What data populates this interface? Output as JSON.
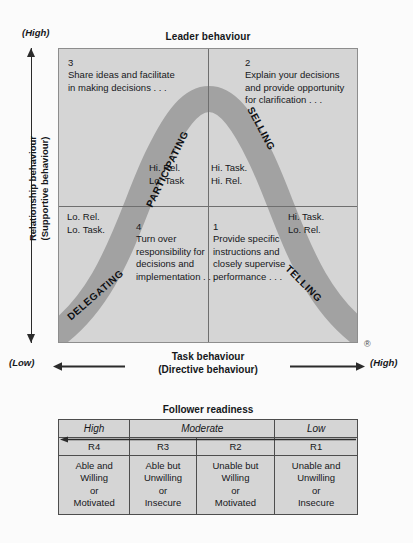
{
  "diagram": {
    "top_axis_title": "Leader behaviour",
    "y_axis": {
      "high_label": "(High)",
      "low_label": "(Low)",
      "title_line1": "Relationship behaviour",
      "title_line2": "(Supportive behaviour)"
    },
    "x_axis": {
      "low_label": "(Low)",
      "high_label": "(High)",
      "title_line1": "Task behaviour",
      "title_line2": "(Directive behaviour)"
    },
    "registered_mark": "®",
    "quadrants": [
      {
        "number": "3",
        "text": "Share ideas and facilitate in making decisions . . ."
      },
      {
        "number": "2",
        "text": "Explain your decisions and provide opportunity for clarification . . ."
      },
      {
        "number": "4",
        "text": "Turn over responsibility for decisions and implementation . . ."
      },
      {
        "number": "1",
        "text": "Provide specific instructions and closely supervise performance . . ."
      }
    ],
    "behaviour_mixes": [
      {
        "line1": "Hi. Rel.",
        "line2": "Lo. Task"
      },
      {
        "line1": "Hi. Task.",
        "line2": "Hi. Rel."
      },
      {
        "line1": "Lo. Rel.",
        "line2": "Lo. Task."
      },
      {
        "line1": "Hi. Task.",
        "line2": "Lo. Rel."
      }
    ],
    "curve_styles": [
      "PARTICIPATING",
      "SELLING",
      "DELEGATING",
      "TELLING"
    ],
    "colors": {
      "plot_background": "#d5d5d5",
      "curve_band": "#a2a2a2",
      "grid_line": "#6f6f6f",
      "axis": "#2b2b2b"
    }
  },
  "follower_readiness": {
    "title": "Follower readiness",
    "levels": [
      "High",
      "Moderate",
      "Low"
    ],
    "codes": [
      "R4",
      "R3",
      "R2",
      "R1"
    ],
    "descriptions": [
      "Able and\nWilling\nor\nMotivated",
      "Able but\nUnwilling\nor\nInsecure",
      "Unable but\nWilling\nor\nMotivated",
      "Unable and\nUnwilling\nor\nInsecure"
    ],
    "cells": [
      {
        "line1": "Able and",
        "line2": "Willing",
        "line3": "or",
        "line4": "Motivated"
      },
      {
        "line1": "Able but",
        "line2": "Unwilling",
        "line3": "or",
        "line4": "Insecure"
      },
      {
        "line1": "Unable but",
        "line2": "Willing",
        "line3": "or",
        "line4": "Motivated"
      },
      {
        "line1": "Unable and",
        "line2": "Unwilling",
        "line3": "or",
        "line4": "Insecure"
      }
    ]
  }
}
